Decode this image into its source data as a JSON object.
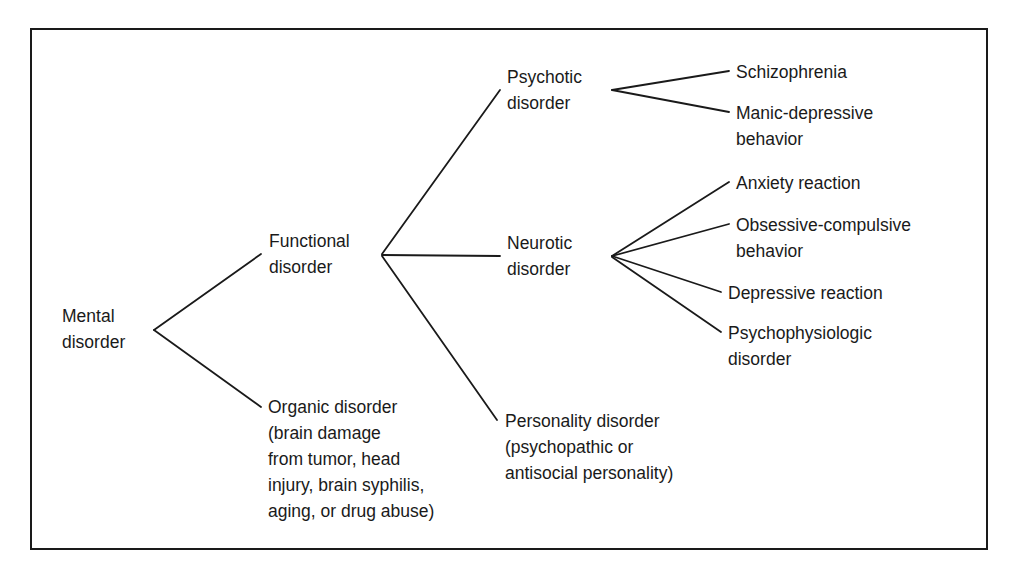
{
  "diagram": {
    "type": "tree",
    "colors": {
      "line": "#1a1a1a",
      "text": "#1a1a1a",
      "background": "#ffffff"
    },
    "root": {
      "label": "Mental\ndisorder",
      "children": [
        "functional",
        "organic"
      ]
    },
    "nodes": {
      "mental": "Mental\ndisorder",
      "functional": "Functional\ndisorder",
      "organic": "Organic disorder\n(brain damage\nfrom tumor, head\ninjury, brain syphilis,\naging, or drug abuse)",
      "psychotic": "Psychotic\ndisorder",
      "neurotic": "Neurotic\ndisorder",
      "personality": "Personality disorder\n(psychopathic or\nantisocial personality)",
      "schizophrenia": "Schizophrenia",
      "manic": "Manic-depressive\nbehavior",
      "anxiety": "Anxiety reaction",
      "obsessive": "Obsessive-compulsive\nbehavior",
      "depressive": "Depressive reaction",
      "psychophysiologic": "Psychophysiologic\ndisorder"
    },
    "edges": [
      [
        "mental",
        "functional"
      ],
      [
        "mental",
        "organic"
      ],
      [
        "functional",
        "psychotic"
      ],
      [
        "functional",
        "neurotic"
      ],
      [
        "functional",
        "personality"
      ],
      [
        "psychotic",
        "schizophrenia"
      ],
      [
        "psychotic",
        "manic"
      ],
      [
        "neurotic",
        "anxiety"
      ],
      [
        "neurotic",
        "obsessive"
      ],
      [
        "neurotic",
        "depressive"
      ],
      [
        "neurotic",
        "psychophysiologic"
      ]
    ]
  }
}
